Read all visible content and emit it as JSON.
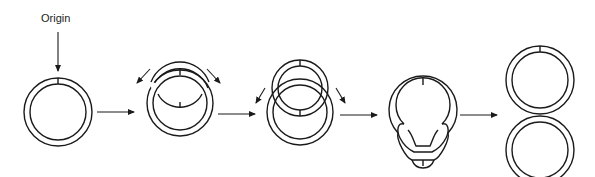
{
  "diagram": {
    "type": "process-flow",
    "origin_label": "Origin",
    "stages": [
      {
        "id": 1,
        "name": "circular-molecule-with-origin"
      },
      {
        "id": 2,
        "name": "replication-bubble-early"
      },
      {
        "id": 3,
        "name": "replication-bubble-expanded"
      },
      {
        "id": 4,
        "name": "replication-near-termination"
      },
      {
        "id": 5,
        "name": "two-daughter-circles"
      }
    ],
    "stroke_color": "#1a1a1a",
    "background_color": "#ffffff"
  }
}
